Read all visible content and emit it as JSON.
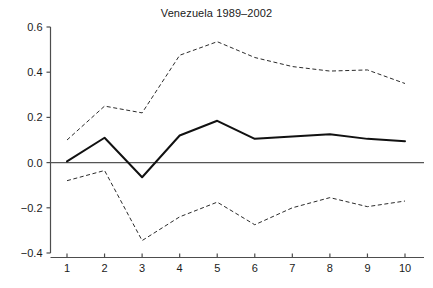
{
  "chart_data": {
    "type": "line",
    "title": "Venezuela 1989–2002",
    "xlabel": "",
    "ylabel": "",
    "x": [
      1,
      2,
      3,
      4,
      5,
      6,
      7,
      8,
      9,
      10
    ],
    "xticklabels": [
      "1",
      "2",
      "3",
      "4",
      "5",
      "6",
      "7",
      "8",
      "9",
      "10"
    ],
    "yticks": [
      -0.4,
      -0.2,
      0.0,
      0.2,
      0.4,
      0.6
    ],
    "yticklabels": [
      "-0.4",
      "-0.2",
      "0.0",
      "0.2",
      "0.4",
      "0.6"
    ],
    "xlim": [
      0.6,
      10.4
    ],
    "ylim": [
      -0.4,
      0.6
    ],
    "grid": false,
    "legend": "none",
    "zero_reference_line": 0.0,
    "series": [
      {
        "name": "upper-confidence-band",
        "style": "dashed",
        "color": "#2b2b2b",
        "values": [
          0.1,
          0.25,
          0.22,
          0.475,
          0.535,
          0.465,
          0.425,
          0.405,
          0.41,
          0.35
        ]
      },
      {
        "name": "point-estimate",
        "style": "solid",
        "color": "#111111",
        "values": [
          0.005,
          0.11,
          -0.065,
          0.12,
          0.185,
          0.105,
          0.115,
          0.125,
          0.105,
          0.095
        ]
      },
      {
        "name": "lower-confidence-band",
        "style": "dashed",
        "color": "#2b2b2b",
        "values": [
          -0.08,
          -0.035,
          -0.345,
          -0.24,
          -0.175,
          -0.275,
          -0.2,
          -0.155,
          -0.195,
          -0.17
        ]
      }
    ]
  }
}
